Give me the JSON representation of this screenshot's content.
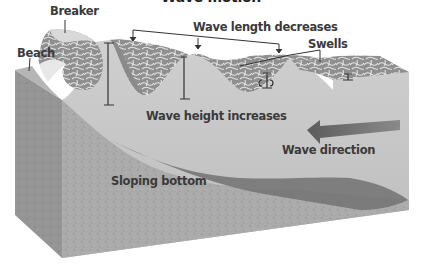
{
  "title": "Wave motion",
  "labels": {
    "breaker": "Breaker",
    "beach": "Beach",
    "wave_length": "Wave length decreases",
    "swells": "Swells",
    "wave_height": "Wave height increases",
    "wave_direction": "Wave direction",
    "sloping_bottom": "Sloping bottom"
  },
  "colors": {
    "background": "#ffffff",
    "water_front": "#c9c9c9",
    "wave_surface": "#9a9a9a",
    "foam": "#e6e6e6",
    "sediment": "#a9a9a9",
    "sediment_side": "#8e8e8e",
    "sloping_shadow": "#6f6f6f",
    "arrow": "#6a6a6a",
    "label_text": "#3a3a3a"
  }
}
